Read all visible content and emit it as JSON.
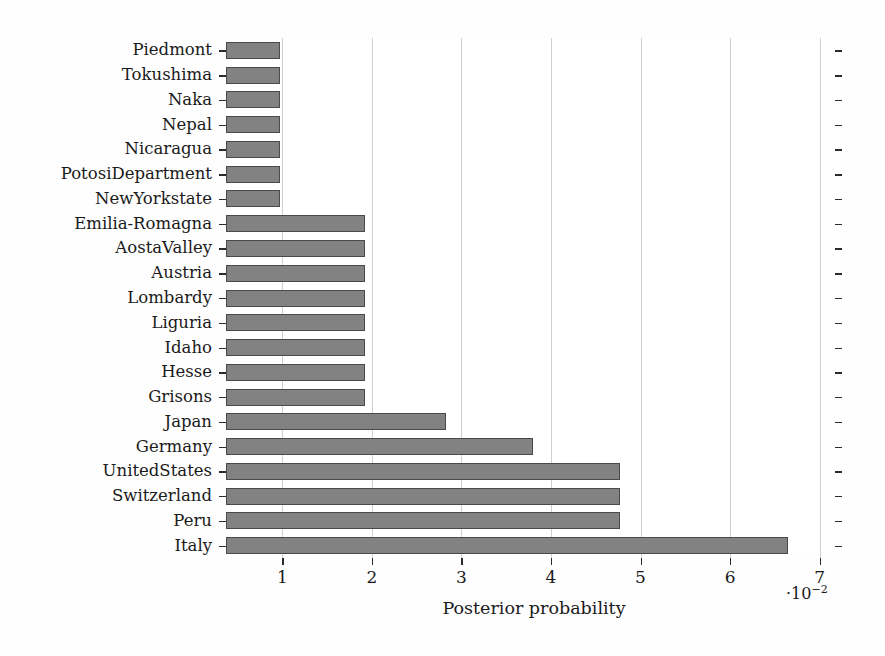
{
  "chart_data": {
    "type": "bar",
    "orientation": "horizontal",
    "title": "",
    "subtitle": "",
    "xlabel": "Posterior probability",
    "ylabel": "",
    "x_exponent_label": "·10",
    "x_exponent_power": "−2",
    "x_scale_multiplier": 0.01,
    "xlim": [
      0.37,
      7.25
    ],
    "xticks": [
      1,
      2,
      3,
      4,
      5,
      6,
      7
    ],
    "xtick_labels": [
      "1",
      "2",
      "3",
      "4",
      "5",
      "6",
      "7"
    ],
    "grid": "vertical",
    "legend": "none",
    "bar_color": "#828282",
    "bar_edge_color": "#4a4a4a",
    "axis_color": "#2b2b2b",
    "grid_color": "#cfcfcf",
    "categories": [
      "Piedmont",
      "Tokushima",
      "Naka",
      "Nepal",
      "Nicaragua",
      "PotosiDepartment",
      "NewYorkstate",
      "Emilia-Romagna",
      "AostaValley",
      "Austria",
      "Lombardy",
      "Liguria",
      "Idaho",
      "Hesse",
      "Grisons",
      "Japan",
      "Germany",
      "UnitedStates",
      "Switzerland",
      "Peru",
      "Italy"
    ],
    "values": [
      0.97,
      0.97,
      0.97,
      0.97,
      0.97,
      0.97,
      0.97,
      1.92,
      1.92,
      1.92,
      1.92,
      1.92,
      1.92,
      1.92,
      1.92,
      2.83,
      3.8,
      4.77,
      4.77,
      4.77,
      6.65
    ]
  }
}
